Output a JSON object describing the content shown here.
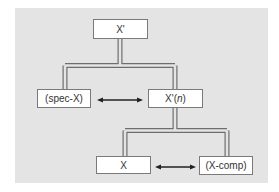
{
  "diagram": {
    "type": "x-bar tree",
    "background_color": "#e4e4e4",
    "nodes": [
      {
        "id": "xbar_max",
        "label": "X'"
      },
      {
        "id": "spec",
        "label": "(spec-X)"
      },
      {
        "id": "xbar_n",
        "label_main": "X'(",
        "label_italic": "n",
        "label_end": ")"
      },
      {
        "id": "head",
        "label": "X"
      },
      {
        "id": "comp",
        "label": "(X-comp)"
      }
    ],
    "edges": [
      {
        "from": "xbar_max",
        "to": "spec",
        "style": "double-line"
      },
      {
        "from": "xbar_max",
        "to": "xbar_n",
        "style": "double-line"
      },
      {
        "from": "xbar_n",
        "to": "head",
        "style": "double-line"
      },
      {
        "from": "xbar_n",
        "to": "comp",
        "style": "double-line"
      }
    ],
    "relations": [
      {
        "between": [
          "spec",
          "xbar_n"
        ],
        "style": "double-headed-arrow"
      },
      {
        "between": [
          "head",
          "comp"
        ],
        "style": "double-headed-arrow"
      }
    ]
  }
}
